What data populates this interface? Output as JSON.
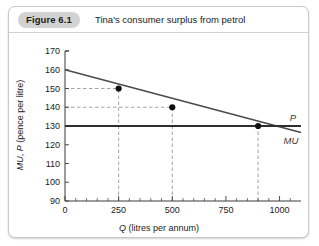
{
  "figure": {
    "badge": "Figure 6.1",
    "title": "Tina's consumer surplus from petrol"
  },
  "chart_data": {
    "type": "line",
    "title": "Tina's consumer surplus from petrol",
    "xlabel_italic": "Q",
    "xlabel_rest": " (litres per annum)",
    "ylabel_italic_1": "MU",
    "ylabel_sep": ", ",
    "ylabel_italic_2": "P",
    "ylabel_rest": " (pence per litre)",
    "xlim": [
      0,
      1100
    ],
    "ylim": [
      90,
      170
    ],
    "xticks": [
      0,
      250,
      500,
      750,
      1000
    ],
    "xtick_labels": [
      "0",
      "250",
      "500",
      "750",
      "1000"
    ],
    "xtick_minor_step": 50,
    "yticks": [
      90,
      100,
      110,
      120,
      130,
      140,
      150,
      160,
      170
    ],
    "ytick_labels": [
      "90",
      "100",
      "110",
      "120",
      "130",
      "140",
      "150",
      "160",
      "170"
    ],
    "grid": false,
    "legend_position": "inline-right",
    "series": [
      {
        "name": "MU",
        "label": "MU",
        "type": "line",
        "x": [
          0,
          1100
        ],
        "values": [
          160,
          126.5
        ],
        "color": "#4a4a4a"
      },
      {
        "name": "P",
        "label": "P",
        "type": "line",
        "x": [
          0,
          1100
        ],
        "values": [
          130,
          130
        ],
        "color": "#2e2e2e"
      }
    ],
    "points": [
      {
        "x": 250,
        "y": 150
      },
      {
        "x": 500,
        "y": 140
      },
      {
        "x": 900,
        "y": 130
      }
    ],
    "guides": [
      {
        "orientation": "horizontal",
        "value": 150,
        "from_x": 0,
        "to_x": 250
      },
      {
        "orientation": "horizontal",
        "value": 140,
        "from_x": 0,
        "to_x": 500
      },
      {
        "orientation": "vertical",
        "value": 250,
        "from_y": 90,
        "to_y": 150
      },
      {
        "orientation": "vertical",
        "value": 500,
        "from_y": 90,
        "to_y": 140
      },
      {
        "orientation": "vertical",
        "value": 900,
        "from_y": 90,
        "to_y": 130
      }
    ]
  }
}
